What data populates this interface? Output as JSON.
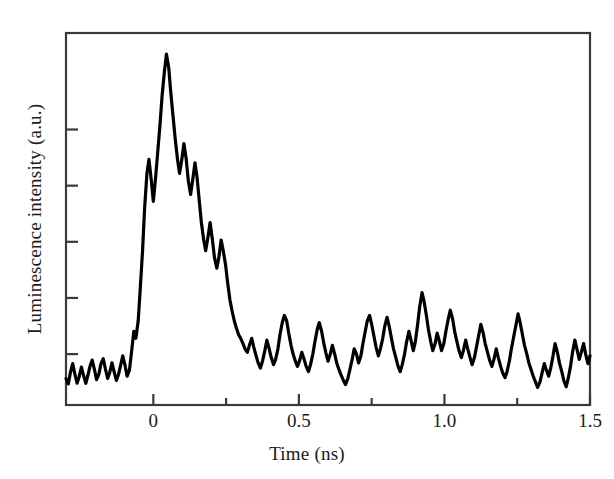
{
  "figure": {
    "background_color": "#ffffff",
    "trace_color": "#000000",
    "axis_color": "#3a3a3a"
  },
  "axes": {
    "x_title": "Time (ns)",
    "y_title": "Luminescence intensity (a.u.)",
    "x_tick_labels": [
      "0",
      "0.5",
      "1.0",
      "1.5"
    ],
    "y_tick_labels": [
      "",
      "",
      "",
      "",
      ""
    ]
  },
  "chart_data": {
    "type": "line",
    "title": "",
    "subtitle": "",
    "xlabel": "Time (ns)",
    "ylabel": "Luminescence intensity (a.u.)",
    "xlim": [
      -0.3,
      1.5
    ],
    "ylim": [
      0,
      1.06
    ],
    "grid": false,
    "legend": null,
    "annotations": [],
    "x_major_ticks": [
      0,
      0.5,
      1.0,
      1.5
    ],
    "x_minor_ticks": [
      0.25,
      0.75,
      1.25
    ],
    "y_major_ticks": [
      0.145,
      0.305,
      0.465,
      0.625,
      0.785
    ],
    "y_axis_labeled": false,
    "series": [
      {
        "name": "Luminescence decay",
        "color": "#000000",
        "line_width": 3.2,
        "x": [
          -0.3,
          -0.292,
          -0.285,
          -0.277,
          -0.27,
          -0.262,
          -0.255,
          -0.247,
          -0.24,
          -0.232,
          -0.225,
          -0.217,
          -0.21,
          -0.202,
          -0.195,
          -0.187,
          -0.18,
          -0.172,
          -0.165,
          -0.157,
          -0.15,
          -0.142,
          -0.135,
          -0.127,
          -0.12,
          -0.112,
          -0.105,
          -0.097,
          -0.09,
          -0.082,
          -0.075,
          -0.067,
          -0.06,
          -0.052,
          -0.045,
          -0.037,
          -0.03,
          -0.022,
          -0.015,
          -0.007,
          0.0,
          0.008,
          0.015,
          0.023,
          0.03,
          0.038,
          0.045,
          0.053,
          0.06,
          0.068,
          0.075,
          0.083,
          0.09,
          0.098,
          0.105,
          0.113,
          0.12,
          0.128,
          0.135,
          0.143,
          0.15,
          0.158,
          0.165,
          0.173,
          0.18,
          0.188,
          0.195,
          0.203,
          0.21,
          0.218,
          0.225,
          0.233,
          0.24,
          0.248,
          0.255,
          0.263,
          0.27,
          0.278,
          0.285,
          0.293,
          0.3,
          0.308,
          0.315,
          0.323,
          0.33,
          0.338,
          0.345,
          0.353,
          0.36,
          0.368,
          0.375,
          0.383,
          0.39,
          0.398,
          0.405,
          0.413,
          0.42,
          0.428,
          0.435,
          0.443,
          0.45,
          0.458,
          0.465,
          0.473,
          0.48,
          0.488,
          0.495,
          0.503,
          0.51,
          0.518,
          0.525,
          0.533,
          0.54,
          0.548,
          0.555,
          0.563,
          0.57,
          0.578,
          0.585,
          0.593,
          0.6,
          0.608,
          0.615,
          0.623,
          0.63,
          0.638,
          0.645,
          0.653,
          0.66,
          0.668,
          0.675,
          0.683,
          0.69,
          0.698,
          0.705,
          0.713,
          0.72,
          0.728,
          0.735,
          0.743,
          0.75,
          0.758,
          0.765,
          0.773,
          0.78,
          0.788,
          0.795,
          0.803,
          0.81,
          0.818,
          0.825,
          0.833,
          0.84,
          0.848,
          0.855,
          0.863,
          0.87,
          0.878,
          0.885,
          0.893,
          0.9,
          0.908,
          0.915,
          0.923,
          0.93,
          0.938,
          0.945,
          0.953,
          0.96,
          0.968,
          0.975,
          0.983,
          0.99,
          0.998,
          1.005,
          1.013,
          1.02,
          1.028,
          1.035,
          1.043,
          1.05,
          1.058,
          1.065,
          1.073,
          1.08,
          1.088,
          1.095,
          1.103,
          1.11,
          1.118,
          1.125,
          1.133,
          1.14,
          1.148,
          1.155,
          1.163,
          1.17,
          1.178,
          1.185,
          1.193,
          1.2,
          1.208,
          1.215,
          1.223,
          1.23,
          1.238,
          1.245,
          1.253,
          1.26,
          1.268,
          1.275,
          1.283,
          1.29,
          1.298,
          1.305,
          1.313,
          1.32,
          1.328,
          1.335,
          1.343,
          1.35,
          1.358,
          1.365,
          1.373,
          1.38,
          1.388,
          1.395,
          1.403,
          1.41,
          1.418,
          1.425,
          1.433,
          1.44,
          1.448,
          1.455,
          1.463,
          1.47,
          1.478,
          1.485,
          1.493,
          1.5
        ],
        "y": [
          0.075,
          0.06,
          0.092,
          0.118,
          0.09,
          0.062,
          0.08,
          0.108,
          0.085,
          0.062,
          0.084,
          0.112,
          0.128,
          0.1,
          0.072,
          0.088,
          0.118,
          0.132,
          0.104,
          0.076,
          0.092,
          0.12,
          0.096,
          0.07,
          0.086,
          0.114,
          0.14,
          0.112,
          0.082,
          0.1,
          0.15,
          0.21,
          0.19,
          0.24,
          0.33,
          0.44,
          0.56,
          0.66,
          0.7,
          0.64,
          0.58,
          0.65,
          0.72,
          0.8,
          0.88,
          0.95,
          1.0,
          0.96,
          0.89,
          0.82,
          0.76,
          0.7,
          0.66,
          0.7,
          0.745,
          0.7,
          0.64,
          0.6,
          0.64,
          0.69,
          0.65,
          0.58,
          0.52,
          0.47,
          0.44,
          0.48,
          0.52,
          0.47,
          0.42,
          0.39,
          0.42,
          0.47,
          0.44,
          0.4,
          0.35,
          0.3,
          0.27,
          0.24,
          0.22,
          0.2,
          0.19,
          0.175,
          0.16,
          0.15,
          0.17,
          0.19,
          0.165,
          0.14,
          0.12,
          0.105,
          0.125,
          0.155,
          0.185,
          0.16,
          0.135,
          0.115,
          0.13,
          0.16,
          0.2,
          0.235,
          0.255,
          0.24,
          0.205,
          0.17,
          0.145,
          0.125,
          0.11,
          0.128,
          0.15,
          0.13,
          0.11,
          0.095,
          0.115,
          0.145,
          0.18,
          0.215,
          0.235,
          0.21,
          0.178,
          0.148,
          0.125,
          0.145,
          0.17,
          0.145,
          0.12,
          0.1,
          0.085,
          0.07,
          0.058,
          0.075,
          0.1,
          0.13,
          0.16,
          0.145,
          0.12,
          0.14,
          0.175,
          0.21,
          0.24,
          0.255,
          0.23,
          0.195,
          0.165,
          0.14,
          0.16,
          0.19,
          0.225,
          0.25,
          0.225,
          0.19,
          0.16,
          0.135,
          0.112,
          0.095,
          0.115,
          0.145,
          0.18,
          0.21,
          0.185,
          0.155,
          0.18,
          0.23,
          0.28,
          0.32,
          0.295,
          0.255,
          0.215,
          0.18,
          0.155,
          0.175,
          0.205,
          0.18,
          0.155,
          0.175,
          0.21,
          0.245,
          0.27,
          0.245,
          0.21,
          0.18,
          0.155,
          0.135,
          0.155,
          0.185,
          0.16,
          0.135,
          0.115,
          0.135,
          0.165,
          0.2,
          0.23,
          0.205,
          0.175,
          0.15,
          0.128,
          0.11,
          0.13,
          0.16,
          0.135,
          0.11,
          0.092,
          0.078,
          0.095,
          0.125,
          0.16,
          0.195,
          0.225,
          0.26,
          0.235,
          0.2,
          0.17,
          0.145,
          0.12,
          0.1,
          0.082,
          0.065,
          0.05,
          0.065,
          0.09,
          0.118,
          0.1,
          0.082,
          0.105,
          0.14,
          0.175,
          0.15,
          0.12,
          0.095,
          0.07,
          0.052,
          0.075,
          0.11,
          0.15,
          0.185,
          0.16,
          0.13,
          0.15,
          0.175,
          0.145,
          0.118,
          0.14
        ]
      }
    ]
  }
}
